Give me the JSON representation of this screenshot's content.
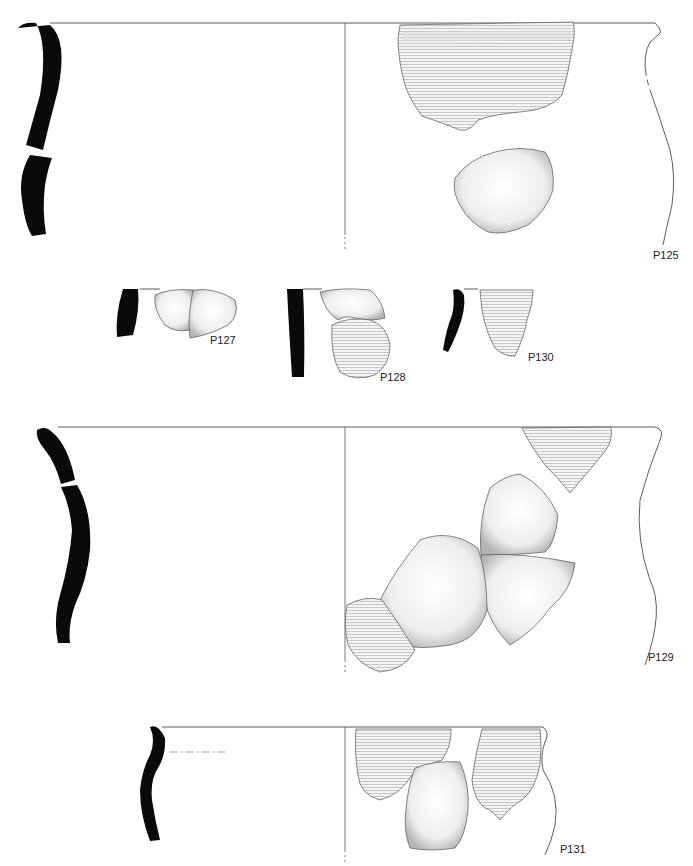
{
  "figure": {
    "vessels": [
      {
        "id": "P125",
        "label": "P125",
        "label_pos": [
          653,
          250
        ]
      },
      {
        "id": "P127",
        "label": "P127",
        "label_pos": [
          210,
          340
        ]
      },
      {
        "id": "P128",
        "label": "P128",
        "label_pos": [
          380,
          377
        ]
      },
      {
        "id": "P130",
        "label": "P130",
        "label_pos": [
          528,
          355
        ]
      },
      {
        "id": "P129",
        "label": "P129",
        "label_pos": [
          648,
          652
        ]
      },
      {
        "id": "P131",
        "label": "P131",
        "label_pos": [
          560,
          845
        ]
      }
    ]
  },
  "colors": {
    "profile_fill": "#0a0a0a",
    "line": "#333333",
    "sherd_fill": "#f1f1f1",
    "sherd_shade": "#bdbdbd"
  }
}
